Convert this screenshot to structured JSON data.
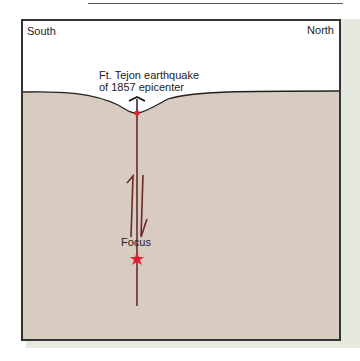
{
  "labels": {
    "south": "South",
    "north": "North",
    "epicenter_line1": "Ft. Tejon earthquake",
    "epicenter_line2": "of 1857 epicenter",
    "focus": "Focus"
  },
  "colors": {
    "ground": "#d8cbc0",
    "sky": "#ffffff",
    "fault": "#6b2a2a",
    "marker": "#e02030",
    "background": "#e6e9df"
  }
}
